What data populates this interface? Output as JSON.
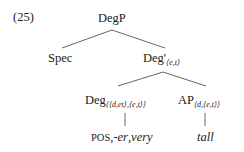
{
  "example": {
    "number": "(25)"
  },
  "tree": {
    "root": {
      "label": "DegP"
    },
    "spec": {
      "label": "Spec"
    },
    "degbar": {
      "label": "Deg'",
      "type": "⟨e,t⟩"
    },
    "deg": {
      "label": "Deg",
      "type": "⟨⟨d,et⟩,⟨e,t⟩⟩"
    },
    "ap": {
      "label": "AP",
      "type": "⟨d,⟨e,t⟩⟩"
    },
    "deg_terminal": {
      "pos": "POS",
      "sep1": ",",
      "er": "-er",
      "sep2": ",",
      "very": "very"
    },
    "ap_terminal": {
      "label": "tall"
    }
  },
  "colors": {
    "line": "#555555",
    "text": "#222222",
    "background": "#ffffff"
  }
}
